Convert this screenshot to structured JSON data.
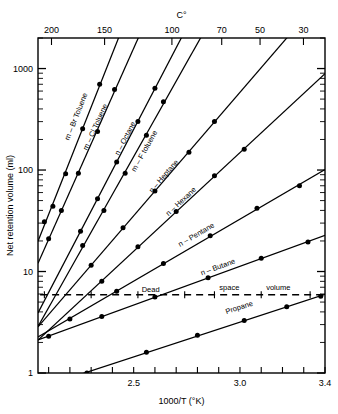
{
  "chart_data": {
    "type": "line",
    "title": "",
    "xlabel": "1000/T  (°K)",
    "ylabel": "Net retention volume (ml)",
    "top_axis_label": "C°",
    "xscale": "linear",
    "yscale": "log",
    "xlim": [
      2.05,
      3.4
    ],
    "ylim": [
      1,
      2000
    ],
    "grid": false,
    "legend": "inline-labels",
    "x_tick_labels": [
      "2.5",
      "3.0",
      "3.4"
    ],
    "x_tick_values": [
      2.5,
      3.0,
      3.4
    ],
    "x_minor_tick_step": 0.1,
    "y_tick_labels": [
      "1",
      "10",
      "100",
      "1000"
    ],
    "y_tick_values": [
      1,
      10,
      100,
      1000
    ],
    "top_tick_labels": [
      "200",
      "150",
      "100",
      "70",
      "50",
      "30"
    ],
    "top_tick_celsius": [
      200,
      150,
      100,
      70,
      50,
      30
    ],
    "annotations": [
      {
        "text": "Dead",
        "x": 2.58,
        "y": 6.3
      },
      {
        "text": "space",
        "x": 2.95,
        "y": 6.6
      },
      {
        "text": "volume",
        "x": 3.18,
        "y": 6.6
      }
    ],
    "reference_line": {
      "label": "Dead space volume",
      "style": "dashed",
      "y": 5.9,
      "x_start": 2.06,
      "x_end": 3.4
    },
    "series": [
      {
        "name": "m – Br Toluene",
        "label": "m – Br Toluene",
        "label_x": 2.24,
        "label_y": 330,
        "x": [
          2.08,
          2.12,
          2.18,
          2.26,
          2.34
        ],
        "y": [
          31,
          44,
          92,
          255,
          700
        ]
      },
      {
        "name": "m – Cl Toluene",
        "label": "m – Cl Toluene",
        "label_x": 2.33,
        "label_y": 260,
        "x": [
          2.1,
          2.16,
          2.24,
          2.33,
          2.41
        ],
        "y": [
          21,
          40,
          93,
          240,
          620
        ]
      },
      {
        "name": "n – Octane",
        "label": "n – Octane",
        "label_x": 2.47,
        "label_y": 200,
        "x": [
          2.25,
          2.33,
          2.42,
          2.52,
          2.6
        ],
        "y": [
          25,
          52,
          120,
          300,
          640
        ]
      },
      {
        "name": "m – F toluene",
        "label": "m – F toluene",
        "label_x": 2.56,
        "label_y": 150,
        "x": [
          2.26,
          2.36,
          2.46,
          2.56,
          2.64
        ],
        "y": [
          18,
          40,
          93,
          220,
          470
        ]
      },
      {
        "name": "n – Heptane",
        "label": "n – Heptane",
        "label_x": 2.65,
        "label_y": 84,
        "x": [
          2.3,
          2.45,
          2.6,
          2.76,
          2.88
        ],
        "y": [
          11.5,
          27,
          62,
          150,
          300
        ]
      },
      {
        "name": "n – Hexane",
        "label": "n – Hexane",
        "label_x": 2.73,
        "label_y": 47,
        "x": [
          2.35,
          2.52,
          2.7,
          2.88,
          3.02
        ],
        "y": [
          8.0,
          17.5,
          39,
          88,
          160
        ]
      },
      {
        "name": "n – Pentane",
        "label": "n – Pentane",
        "label_x": 2.8,
        "label_y": 22,
        "x": [
          2.2,
          2.42,
          2.64,
          2.86,
          3.08,
          3.28
        ],
        "y": [
          3.4,
          6.4,
          12.0,
          22.5,
          42,
          70
        ]
      },
      {
        "name": "n – Butane",
        "label": "n – Butane",
        "label_x": 2.9,
        "label_y": 10.5,
        "x": [
          2.1,
          2.35,
          2.6,
          2.85,
          3.1,
          3.32
        ],
        "y": [
          2.3,
          3.6,
          5.6,
          8.7,
          13.5,
          19.5
        ]
      },
      {
        "name": "Propane",
        "label": "Propane",
        "label_x": 3.0,
        "label_y": 4.2,
        "x": [
          2.28,
          2.56,
          2.8,
          3.02,
          3.22,
          3.38
        ],
        "y": [
          1.0,
          1.6,
          2.35,
          3.3,
          4.5,
          5.7
        ]
      }
    ]
  },
  "axes": {
    "y_axis_title": "Net retention volume (ml)",
    "x_axis_title": "1000/T  (°K)",
    "top_axis_title": "C°"
  }
}
